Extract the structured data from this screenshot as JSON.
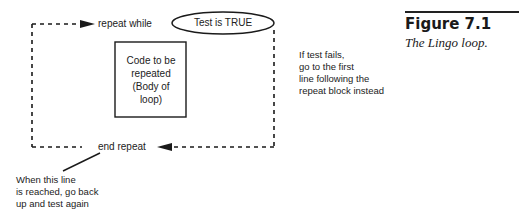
{
  "figure": {
    "number_label": "Figure 7.1",
    "caption": "The Lingo loop."
  },
  "diagram": {
    "top_label": "repeat while",
    "condition_ellipse": "Test is TRUE",
    "body_box": {
      "lines": [
        "Code to be",
        "repeated",
        "(Body of",
        "loop)"
      ]
    },
    "bottom_label": "end repeat",
    "fail_note": {
      "lines": [
        "If test fails,",
        "go to the first",
        "line following the",
        "repeat block instead"
      ]
    },
    "return_note": {
      "lines": [
        "When this line",
        "is reached, go back",
        "up and test again"
      ]
    },
    "colors": {
      "line": "#1a1a1a",
      "background": "#ffffff"
    }
  }
}
